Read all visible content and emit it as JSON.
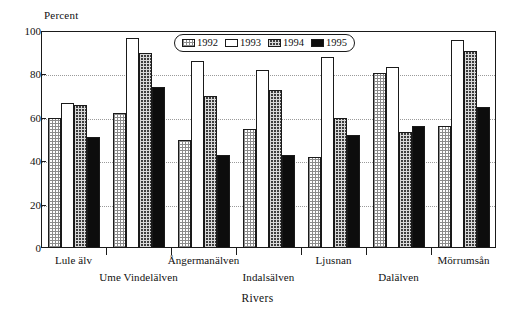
{
  "chart_data": {
    "type": "bar",
    "title": "",
    "xlabel": "Rivers",
    "ylabel": "Percent",
    "ylim": [
      0,
      100
    ],
    "yticks": [
      0,
      20,
      40,
      60,
      80,
      100
    ],
    "grid": true,
    "legend_position": "top-center",
    "categories": [
      "Lule älv",
      "Ume Vindelälven",
      "Ångermanälven",
      "Indalsälven",
      "Ljusnan",
      "Dalälven",
      "Mörrumsån"
    ],
    "series": [
      {
        "name": "1992",
        "values": [
          60,
          62,
          50,
          55,
          42,
          80.5,
          56
        ]
      },
      {
        "name": "1993",
        "values": [
          67,
          97,
          86,
          82,
          88,
          83.5,
          96
        ]
      },
      {
        "name": "1994",
        "values": [
          66,
          90,
          70,
          73,
          60,
          53.5,
          91
        ]
      },
      {
        "name": "1995",
        "values": [
          51,
          74,
          43,
          43,
          52,
          56,
          65
        ]
      }
    ]
  },
  "legend": {
    "items": [
      {
        "label": "1992",
        "swatch": "light-dotted-swatch"
      },
      {
        "label": "1993",
        "swatch": "white-swatch"
      },
      {
        "label": "1994",
        "swatch": "dark-dotted-swatch"
      },
      {
        "label": "1995",
        "swatch": "black-swatch"
      }
    ]
  },
  "axes": {
    "y_title": "Percent",
    "x_title": "Rivers",
    "y_tick_labels": [
      "0",
      "20",
      "40",
      "60",
      "80",
      "100"
    ]
  },
  "colors": {
    "axis": "#1a1a1a",
    "grid": "#9a9a9a",
    "series_1992": "#cfcfcf",
    "series_1993": "#ffffff",
    "series_1994": "#4a4a4a",
    "series_1995": "#0d0d0d"
  }
}
